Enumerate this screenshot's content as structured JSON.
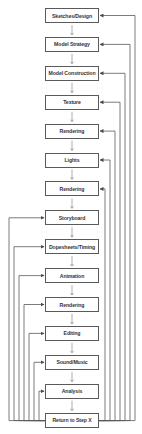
{
  "diagram": {
    "title": "",
    "steps": [
      {
        "label": "Sketches/Design",
        "loop_side": "right"
      },
      {
        "label": "Model Strategy",
        "loop_side": "right"
      },
      {
        "label": "Model Construction",
        "loop_side": "right"
      },
      {
        "label": "Texture",
        "loop_side": "right"
      },
      {
        "label": "Rendering",
        "loop_side": "right"
      },
      {
        "label": "Lights",
        "loop_side": "right"
      },
      {
        "label": "Rendering",
        "loop_side": "right"
      },
      {
        "label": "Storyboard",
        "loop_side": "left"
      },
      {
        "label": "Dopesheets/Timing",
        "loop_side": "left"
      },
      {
        "label": "Animation",
        "loop_side": "left"
      },
      {
        "label": "Rendering",
        "loop_side": "left"
      },
      {
        "label": "Editing",
        "loop_side": "left"
      },
      {
        "label": "Sound/Music",
        "loop_side": "left"
      },
      {
        "label": "Analysis",
        "loop_side": "left"
      },
      {
        "label": "Return to Step X",
        "loop_side": "source"
      }
    ],
    "colors": {
      "line": "#5a5a5a",
      "text": "#333333",
      "background": "#ffffff"
    }
  }
}
